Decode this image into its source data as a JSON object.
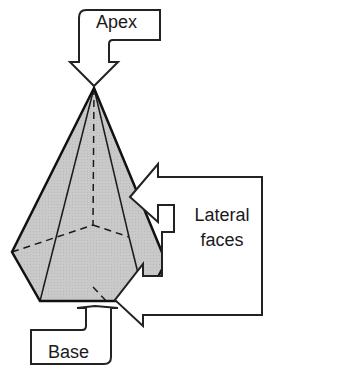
{
  "figure": {
    "callouts": {
      "apex": "Apex",
      "lateral_line1": "Lateral",
      "lateral_line2": "faces",
      "base": "Base"
    },
    "colors": {
      "face_fill": "#c8c8c8",
      "stroke": "#1a1a1a",
      "background": "#ffffff"
    }
  }
}
